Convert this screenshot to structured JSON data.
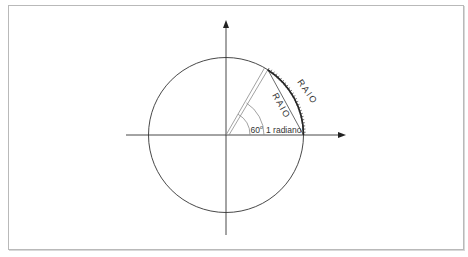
{
  "diagram": {
    "type": "unit-circle-radian",
    "labels": {
      "angle_60": "60",
      "angle_60_sup": "o",
      "radian": "1 radiano",
      "raio_chord": "RAIO",
      "raio_arc": "RAIO"
    },
    "geometry": {
      "center": [
        226,
        135
      ],
      "radius": 77.5,
      "angle_60_deg": 60,
      "angle_radian_deg": 57.3
    },
    "colors": {
      "stroke": "#333333",
      "light_stroke": "#8a8a8a",
      "frame": "#b9b9b9",
      "background": "#ffffff"
    }
  }
}
